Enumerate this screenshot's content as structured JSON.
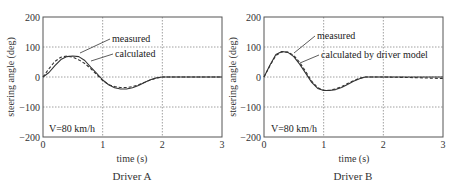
{
  "chart_data": [
    {
      "type": "line",
      "title": "Driver A",
      "xlabel": "time (s)",
      "ylabel": "steering angle (deg)",
      "xlim": [
        0,
        3
      ],
      "ylim": [
        -200,
        200
      ],
      "xticks": [
        0,
        1,
        2,
        3
      ],
      "yticks": [
        200,
        100,
        0,
        -100,
        -200
      ],
      "grid": "dotted",
      "annotation": "V=80 km/h",
      "series": [
        {
          "name": "measured",
          "style": "solid",
          "x": [
            0,
            0.1,
            0.2,
            0.3,
            0.4,
            0.5,
            0.6,
            0.7,
            0.8,
            0.9,
            1.0,
            1.1,
            1.2,
            1.3,
            1.4,
            1.5,
            1.6,
            1.7,
            1.8,
            1.9,
            2.0,
            2.5,
            3.0
          ],
          "values": [
            0,
            15,
            38,
            58,
            68,
            70,
            68,
            55,
            33,
            12,
            -10,
            -26,
            -36,
            -40,
            -40,
            -36,
            -28,
            -18,
            -9,
            -3,
            0,
            0,
            0
          ]
        },
        {
          "name": "calculated",
          "style": "dashed",
          "x": [
            0,
            0.1,
            0.2,
            0.3,
            0.4,
            0.5,
            0.6,
            0.7,
            0.8,
            0.9,
            1.0,
            1.1,
            1.2,
            1.3,
            1.4,
            1.5,
            1.6,
            1.7,
            1.8,
            1.9,
            2.0,
            2.5,
            3.0
          ],
          "values": [
            0,
            28,
            52,
            66,
            70,
            66,
            57,
            45,
            28,
            8,
            -12,
            -25,
            -32,
            -35,
            -35,
            -32,
            -26,
            -18,
            -10,
            -4,
            0,
            0,
            0
          ]
        }
      ],
      "labels": {
        "measured": "measured",
        "calculated": "calculated"
      }
    },
    {
      "type": "line",
      "title": "Driver B",
      "xlabel": "time (s)",
      "ylabel": "steering angle (deg)",
      "xlim": [
        0,
        3
      ],
      "ylim": [
        -200,
        200
      ],
      "xticks": [
        0,
        1,
        2,
        3
      ],
      "yticks": [
        200,
        100,
        0,
        -100,
        -200
      ],
      "grid": "dotted",
      "annotation": "V=80 km/h",
      "series": [
        {
          "name": "measured",
          "style": "solid",
          "x": [
            0,
            0.1,
            0.2,
            0.3,
            0.4,
            0.5,
            0.6,
            0.7,
            0.8,
            0.9,
            1.0,
            1.1,
            1.2,
            1.3,
            1.4,
            1.5,
            1.6,
            1.7,
            2.0,
            2.5,
            3.0
          ],
          "values": [
            0,
            40,
            75,
            85,
            82,
            68,
            42,
            12,
            -18,
            -38,
            -45,
            -45,
            -42,
            -35,
            -25,
            -14,
            -6,
            0,
            0,
            0,
            0
          ]
        },
        {
          "name": "calculated by driver model",
          "style": "dashed",
          "x": [
            0,
            0.1,
            0.2,
            0.3,
            0.4,
            0.5,
            0.6,
            0.7,
            0.8,
            0.9,
            1.0,
            1.1,
            1.2,
            1.3,
            1.4,
            1.5,
            1.6,
            1.7,
            2.0,
            2.5,
            3.0
          ],
          "values": [
            0,
            38,
            72,
            84,
            83,
            72,
            48,
            18,
            -14,
            -36,
            -44,
            -44,
            -40,
            -32,
            -22,
            -12,
            -4,
            0,
            0,
            -2,
            -5
          ]
        }
      ],
      "labels": {
        "measured": "measured",
        "calculated": "calculated by driver model"
      }
    }
  ],
  "panels": {
    "a": {
      "caption": "Driver A",
      "xlabel": "time (s)",
      "ylabel": "steering angle (deg)",
      "speed": "V=80 km/h",
      "label_measured": "measured",
      "label_calculated": "calculated",
      "yticks": [
        "200",
        "100",
        "0",
        "−100",
        "−200"
      ],
      "xticks": [
        "0",
        "1",
        "2",
        "3"
      ]
    },
    "b": {
      "caption": "Driver B",
      "xlabel": "time (s)",
      "ylabel": "steering angle (deg)",
      "speed": "V=80 km/h",
      "label_measured": "measured",
      "label_calculated": "calculated by driver model",
      "yticks": [
        "200",
        "100",
        "0",
        "−100",
        "−200"
      ],
      "xticks": [
        "0",
        "1",
        "2",
        "3"
      ]
    }
  },
  "colors": {
    "line": "#333333",
    "grid": "#888888",
    "frame": "#555555"
  }
}
